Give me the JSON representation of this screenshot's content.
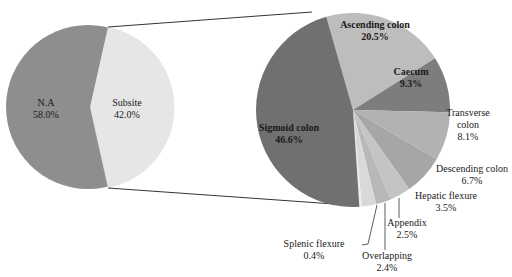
{
  "chart_data": [
    {
      "type": "pie",
      "title": "",
      "categories": [
        "N.A",
        "Subsite"
      ],
      "values": [
        58.0,
        42.0
      ],
      "labels": [
        "N.A\n58.0%",
        "Subsite\n42.0%"
      ],
      "colors": [
        "#8e8e8e",
        "#e6e6e6"
      ],
      "legend": "none (inline labels)"
    },
    {
      "type": "pie",
      "title": "",
      "note": "Breakdown of the 'Subsite' slice (pie-of-pie)",
      "categories": [
        "Ascending colon",
        "Caecum",
        "Transverse colon",
        "Descending colon",
        "Hepatic flexure",
        "Appendix",
        "Overlapping",
        "Splenic flexure",
        "Sigmoid colon"
      ],
      "values": [
        20.5,
        9.3,
        8.1,
        6.7,
        3.5,
        2.5,
        2.4,
        0.4,
        46.6
      ],
      "colors": [
        "#bdbdbd",
        "#7d7d7d",
        "#b2b2b2",
        "#a6a6a6",
        "#c4c4c4",
        "#b8b8b8",
        "#d9d9d9",
        "#ececec",
        "#707070"
      ],
      "legend": "none (inline and callout labels)"
    }
  ],
  "left_pie": {
    "na": {
      "name": "N.A",
      "pct": "58.0%"
    },
    "subsite": {
      "name": "Subsite",
      "pct": "42.0%"
    }
  },
  "right_pie": {
    "ascending": {
      "name": "Ascending colon",
      "pct": "20.5%"
    },
    "caecum": {
      "name": "Caecum",
      "pct": "9.3%"
    },
    "transverse": {
      "name1": "Transverse",
      "name2": "colon",
      "pct": "8.1%"
    },
    "descending": {
      "name": "Descending colon",
      "pct": "6.7%"
    },
    "hepatic": {
      "name": "Hepatic flexure",
      "pct": "3.5%"
    },
    "appendix": {
      "name": "Appendix",
      "pct": "2.5%"
    },
    "overlapping": {
      "name": "Overlapping",
      "pct": "2.4%"
    },
    "splenic": {
      "name": "Splenic flexure",
      "pct": "0.4%"
    },
    "sigmoid": {
      "name": "Sigmoid colon",
      "pct": "46.6%"
    }
  }
}
